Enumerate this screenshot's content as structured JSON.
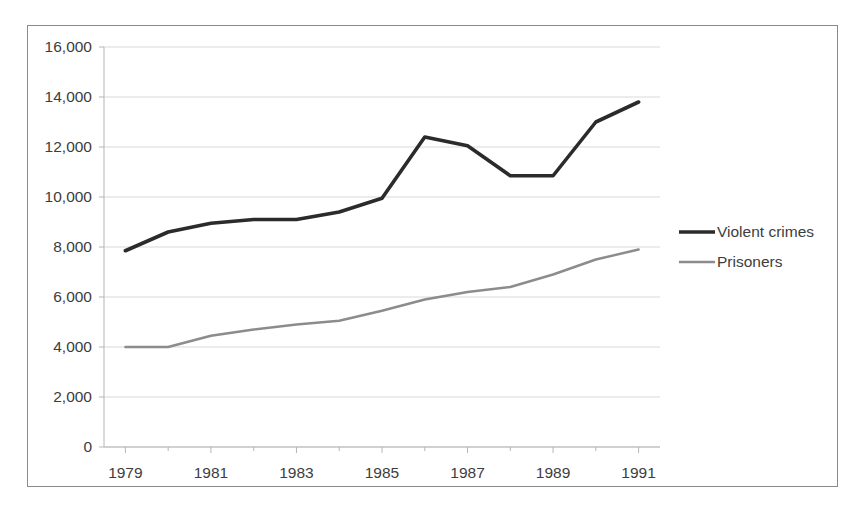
{
  "chart_data": {
    "type": "line",
    "title": "",
    "subtitle": "",
    "xlabel": "",
    "ylabel": "",
    "x": [
      1979,
      1980,
      1981,
      1982,
      1983,
      1984,
      1985,
      1986,
      1987,
      1988,
      1989,
      1990,
      1991
    ],
    "xtick_labels": [
      "1979",
      "1981",
      "1983",
      "1985",
      "1987",
      "1989",
      "1991"
    ],
    "xtick_values": [
      1979,
      1981,
      1983,
      1985,
      1987,
      1989,
      1991
    ],
    "xlim": [
      1978.5,
      1991.5
    ],
    "ytick_labels": [
      "0",
      "2,000",
      "4,000",
      "6,000",
      "8,000",
      "10,000",
      "12,000",
      "14,000",
      "16,000"
    ],
    "ytick_values": [
      0,
      2000,
      4000,
      6000,
      8000,
      10000,
      12000,
      14000,
      16000
    ],
    "ylim": [
      0,
      16000
    ],
    "grid": "horizontal",
    "legend_position": "right",
    "series": [
      {
        "name": "Violent crimes",
        "color": "#2b2b2b",
        "width": 3.6,
        "values": [
          7850,
          8600,
          8950,
          9100,
          9100,
          9400,
          9950,
          12400,
          12050,
          10850,
          10850,
          13000,
          13800
        ]
      },
      {
        "name": "Prisoners",
        "color": "#8c8c8c",
        "width": 2.4,
        "values": [
          4000,
          4000,
          4450,
          4700,
          4900,
          5050,
          5450,
          5900,
          6200,
          6400,
          6900,
          7500,
          7900
        ]
      }
    ]
  },
  "colors": {
    "frame_border": "#8a8a8a",
    "gridline": "#d9d9d9",
    "axis": "#b5b5b5",
    "text": "#3d3d3d",
    "background": "#ffffff"
  }
}
